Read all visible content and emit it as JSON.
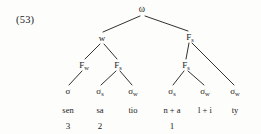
{
  "figure": {
    "example_label": "(53)",
    "caption_word": "sensationality",
    "background_color": "#fdfdfc",
    "line_color": "#1a1a1a"
  },
  "tree": {
    "type": "prosodic-constituent-tree",
    "root": {
      "id": "omega",
      "label": "ω",
      "x": 142,
      "y": 10
    },
    "level2": [
      {
        "id": "w-left",
        "label": "w",
        "sub": "",
        "x": 102,
        "y": 38
      },
      {
        "id": "fs-right",
        "label": "F",
        "sub": "s",
        "x": 190,
        "y": 37
      }
    ],
    "level3": [
      {
        "id": "fw-1",
        "label": "F",
        "sub": "w",
        "x": 84,
        "y": 65
      },
      {
        "id": "fs-1",
        "label": "F",
        "sub": "s",
        "x": 118,
        "y": 65
      },
      {
        "id": "fs-2",
        "label": "F",
        "sub": "s",
        "x": 186,
        "y": 65
      }
    ],
    "leaves": [
      {
        "id": "syl-1",
        "label": "σ",
        "sub": "",
        "x": 68,
        "y": 91,
        "text": "sen",
        "number": "3"
      },
      {
        "id": "syl-2",
        "label": "σ",
        "sub": "s",
        "x": 100,
        "y": 91,
        "text": "sa",
        "number": "2"
      },
      {
        "id": "syl-3",
        "label": "σ",
        "sub": "w",
        "x": 133,
        "y": 91,
        "text": "tio",
        "number": ""
      },
      {
        "id": "syl-4",
        "label": "σ",
        "sub": "s",
        "x": 172,
        "y": 91,
        "text": "n + a",
        "number": "1"
      },
      {
        "id": "syl-5",
        "label": "σ",
        "sub": "w",
        "x": 205,
        "y": 91,
        "text": "l + i",
        "number": ""
      },
      {
        "id": "syl-6",
        "label": "σ",
        "sub": "w",
        "x": 235,
        "y": 91,
        "text": "ty",
        "number": ""
      }
    ],
    "rows": {
      "text_y": 110,
      "number_y": 126
    },
    "edges": [
      {
        "from": "omega",
        "to": "w-left",
        "x1": 140,
        "y1": 16,
        "x2": 103,
        "y2": 32
      },
      {
        "from": "omega",
        "to": "fs-right",
        "x1": 145,
        "y1": 16,
        "x2": 188,
        "y2": 31
      },
      {
        "from": "w-left",
        "to": "fw-1",
        "x1": 100,
        "y1": 44,
        "x2": 85,
        "y2": 59
      },
      {
        "from": "w-left",
        "to": "fs-1",
        "x1": 104,
        "y1": 44,
        "x2": 117,
        "y2": 59
      },
      {
        "from": "fs-right",
        "to": "fs-2",
        "x1": 189,
        "y1": 43,
        "x2": 186,
        "y2": 59
      },
      {
        "from": "fs-right",
        "to": "syl-6",
        "x1": 192,
        "y1": 43,
        "x2": 234,
        "y2": 85
      },
      {
        "from": "fw-1",
        "to": "syl-1",
        "x1": 82,
        "y1": 71,
        "x2": 69,
        "y2": 85
      },
      {
        "from": "fs-1",
        "to": "syl-2",
        "x1": 116,
        "y1": 71,
        "x2": 101,
        "y2": 85
      },
      {
        "from": "fs-1",
        "to": "syl-3",
        "x1": 120,
        "y1": 71,
        "x2": 132,
        "y2": 85
      },
      {
        "from": "fs-2",
        "to": "syl-4",
        "x1": 184,
        "y1": 71,
        "x2": 173,
        "y2": 85
      },
      {
        "from": "fs-2",
        "to": "syl-5",
        "x1": 188,
        "y1": 71,
        "x2": 204,
        "y2": 85
      }
    ]
  }
}
